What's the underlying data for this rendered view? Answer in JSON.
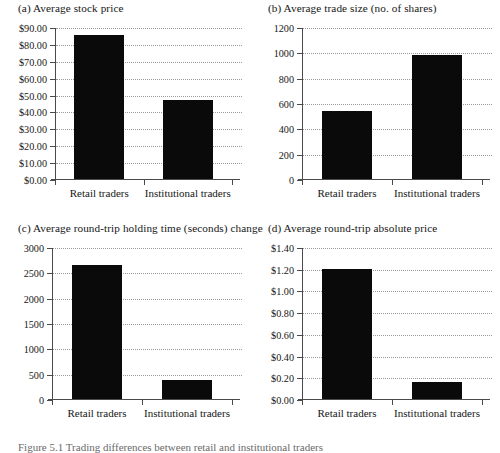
{
  "figure": {
    "caption": "Figure 5.1   Trading differences between retail and institutional traders",
    "categories": [
      "Retail traders",
      "Institutional traders"
    ],
    "bar_color": "#0a0a0a",
    "axis_color": "#4a4a4a",
    "grid_color": "#9a9a9a"
  },
  "chart_data": [
    {
      "type": "bar",
      "panel": "a",
      "title": "(a) Average stock price",
      "categories": [
        "Retail traders",
        "Institutional traders"
      ],
      "values": [
        85.0,
        46.5
      ],
      "xlabel": "",
      "ylabel": "",
      "ylim": [
        0,
        90
      ],
      "ytick_values": [
        0,
        10,
        20,
        30,
        40,
        50,
        60,
        70,
        80,
        90
      ],
      "ytick_labels": [
        "$0.00",
        "$10.00",
        "$20.00",
        "$30.00",
        "$40.00",
        "$50.00",
        "$60.00",
        "$70.00",
        "$80.00",
        "$90.00"
      ],
      "grid": true,
      "legend": "none"
    },
    {
      "type": "bar",
      "panel": "b",
      "title": "(b) Average trade size (no. of shares)",
      "categories": [
        "Retail traders",
        "Institutional traders"
      ],
      "values": [
        540,
        980
      ],
      "xlabel": "",
      "ylabel": "",
      "ylim": [
        0,
        1200
      ],
      "ytick_values": [
        0,
        200,
        400,
        600,
        800,
        1000,
        1200
      ],
      "ytick_labels": [
        "0",
        "200",
        "400",
        "600",
        "800",
        "1000",
        "1200"
      ],
      "grid": true,
      "legend": "none"
    },
    {
      "type": "bar",
      "panel": "c",
      "title": "(c) Average round-trip holding time (seconds) change",
      "categories": [
        "Retail traders",
        "Institutional traders"
      ],
      "values": [
        2650,
        375
      ],
      "xlabel": "",
      "ylabel": "",
      "ylim": [
        0,
        3000
      ],
      "ytick_values": [
        0,
        500,
        1000,
        1500,
        2000,
        2500,
        3000
      ],
      "ytick_labels": [
        "0",
        "500",
        "1000",
        "1500",
        "2000",
        "2500",
        "3000"
      ],
      "grid": true,
      "legend": "none"
    },
    {
      "type": "bar",
      "panel": "d",
      "title": "(d) Average round-trip absolute price",
      "categories": [
        "Retail traders",
        "Institutional traders"
      ],
      "values": [
        1.2,
        0.155
      ],
      "xlabel": "",
      "ylabel": "",
      "ylim": [
        0,
        1.4
      ],
      "ytick_values": [
        0,
        0.2,
        0.4,
        0.6,
        0.8,
        1.0,
        1.2,
        1.4
      ],
      "ytick_labels": [
        "$0.00",
        "$0.20",
        "$0.40",
        "$0.60",
        "$0.80",
        "$1.00",
        "$1.20",
        "$1.40"
      ],
      "grid": true,
      "legend": "none"
    }
  ]
}
